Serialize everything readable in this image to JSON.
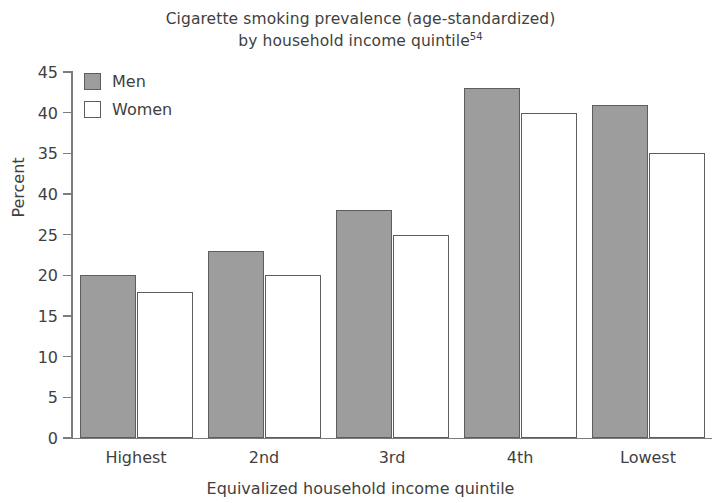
{
  "chart_data": {
    "type": "bar",
    "title": "Cigarette smoking prevalence (age-standardized) by household income quintile",
    "title_lines": [
      "Cigarette smoking prevalence (age-standardized)",
      "by household income quintile"
    ],
    "title_superscript": "54",
    "xlabel": "Equivalized household income quintile",
    "ylabel": "Percent",
    "categories": [
      "Highest",
      "2nd",
      "3rd",
      "4th",
      "Lowest"
    ],
    "series": [
      {
        "name": "Men",
        "values": [
          20,
          23,
          28,
          43,
          41
        ],
        "color": "#9d9d9d"
      },
      {
        "name": "Women",
        "values": [
          18,
          20,
          25,
          40,
          35
        ],
        "color": "#ffffff"
      }
    ],
    "ylim": [
      0,
      45
    ],
    "ytick_values": [
      0,
      5,
      10,
      15,
      20,
      25,
      30,
      35,
      40,
      45
    ],
    "ytick_labels": [
      "0",
      "5",
      "10",
      "15",
      "20",
      "25",
      "40",
      "35",
      "40",
      "45"
    ],
    "grid": false,
    "legend_position": "top-left"
  },
  "legend": {
    "entries": [
      {
        "label": "Men"
      },
      {
        "label": "Women"
      }
    ]
  }
}
